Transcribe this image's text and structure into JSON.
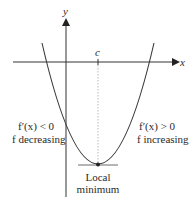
{
  "figure": {
    "axes": {
      "x_label": "x",
      "y_label": "y",
      "point_label": "c"
    },
    "annotations": {
      "left_line1": "f′(x) < 0",
      "left_line2": "f decreasing",
      "right_line1": "f′(x) > 0",
      "right_line2": "f increasing",
      "min_line1": "Local",
      "min_line2": "minimum"
    },
    "colors": {
      "curve": "#3a3a3a",
      "axis": "#333333",
      "dotted": "#999999",
      "text": "#2a2a2a"
    }
  }
}
